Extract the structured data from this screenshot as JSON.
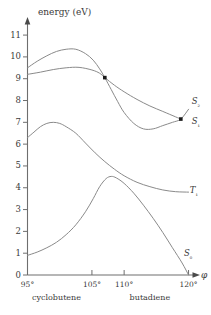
{
  "chart_data": {
    "type": "line",
    "title": "",
    "xlabel": "φ",
    "ylabel": "energy (eV)",
    "xlim": [
      95,
      121
    ],
    "ylim": [
      0,
      11.6
    ],
    "grid": false,
    "legend_position": "inline-right",
    "x_tick_labels": [
      "95°",
      "105°",
      "110°",
      "120°"
    ],
    "x_tick_values": [
      95,
      105,
      110,
      120
    ],
    "y_tick_labels": [
      "0",
      "1",
      "2",
      "3",
      "4",
      "5",
      "6",
      "7",
      "8",
      "9",
      "10",
      "11"
    ],
    "y_tick_values": [
      0,
      1,
      2,
      3,
      4,
      5,
      6,
      7,
      8,
      9,
      10,
      11
    ],
    "annotations": [
      {
        "name": "cyclobutene",
        "text": "cyclobutene",
        "x": 99.5
      },
      {
        "name": "butadiene",
        "text": "butadiene",
        "x": 114.0
      }
    ],
    "markers": [
      {
        "name": "conical-intersection",
        "x": 107.0,
        "y": 9.05
      },
      {
        "name": "s1-s2-convergence",
        "x": 118.8,
        "y": 7.15
      }
    ],
    "series": [
      {
        "name": "S2",
        "label": "S₂",
        "label_x": 120.8,
        "label_y": 7.95,
        "points": [
          [
            95.0,
            9.5
          ],
          [
            96.5,
            9.8
          ],
          [
            98.0,
            10.05
          ],
          [
            99.5,
            10.25
          ],
          [
            101.0,
            10.35
          ],
          [
            102.5,
            10.35
          ],
          [
            104.0,
            10.15
          ],
          [
            105.2,
            9.85
          ],
          [
            106.2,
            9.45
          ],
          [
            107.0,
            9.05
          ],
          [
            108.0,
            8.5
          ],
          [
            109.0,
            7.95
          ],
          [
            110.0,
            7.45
          ],
          [
            111.5,
            6.95
          ],
          [
            113.0,
            6.7
          ],
          [
            114.5,
            6.7
          ],
          [
            116.0,
            6.85
          ],
          [
            117.5,
            7.0
          ],
          [
            118.8,
            7.15
          ],
          [
            120.0,
            7.6
          ]
        ]
      },
      {
        "name": "S1",
        "label": "S₁",
        "label_x": 120.8,
        "label_y": 7.0,
        "points": [
          [
            95.0,
            9.2
          ],
          [
            97.0,
            9.3
          ],
          [
            99.0,
            9.42
          ],
          [
            101.0,
            9.5
          ],
          [
            103.0,
            9.52
          ],
          [
            105.0,
            9.4
          ],
          [
            106.2,
            9.25
          ],
          [
            107.0,
            9.05
          ],
          [
            108.5,
            8.7
          ],
          [
            110.0,
            8.4
          ],
          [
            112.0,
            8.05
          ],
          [
            114.0,
            7.75
          ],
          [
            116.0,
            7.5
          ],
          [
            118.0,
            7.25
          ],
          [
            118.8,
            7.15
          ]
        ]
      },
      {
        "name": "T1",
        "label": "T₁",
        "label_x": 120.5,
        "label_y": 3.85,
        "points": [
          [
            95.0,
            6.3
          ],
          [
            96.0,
            6.55
          ],
          [
            97.0,
            6.8
          ],
          [
            98.0,
            6.95
          ],
          [
            99.0,
            7.0
          ],
          [
            100.0,
            6.95
          ],
          [
            101.0,
            6.8
          ],
          [
            102.5,
            6.5
          ],
          [
            104.0,
            6.05
          ],
          [
            105.5,
            5.6
          ],
          [
            107.0,
            5.2
          ],
          [
            108.5,
            4.85
          ],
          [
            110.0,
            4.55
          ],
          [
            112.0,
            4.25
          ],
          [
            114.0,
            4.05
          ],
          [
            116.0,
            3.9
          ],
          [
            118.0,
            3.82
          ],
          [
            120.0,
            3.8
          ]
        ]
      },
      {
        "name": "S0",
        "label": "S₀",
        "label_x": 119.6,
        "label_y": 0.95,
        "points": [
          [
            95.0,
            0.9
          ],
          [
            96.5,
            1.05
          ],
          [
            98.0,
            1.25
          ],
          [
            99.5,
            1.5
          ],
          [
            101.0,
            1.85
          ],
          [
            102.5,
            2.3
          ],
          [
            104.0,
            2.9
          ],
          [
            105.2,
            3.5
          ],
          [
            106.2,
            4.05
          ],
          [
            107.2,
            4.42
          ],
          [
            108.0,
            4.52
          ],
          [
            108.8,
            4.45
          ],
          [
            110.0,
            4.2
          ],
          [
            111.5,
            3.75
          ],
          [
            113.0,
            3.2
          ],
          [
            114.5,
            2.6
          ],
          [
            116.0,
            1.95
          ],
          [
            117.5,
            1.25
          ],
          [
            119.0,
            0.55
          ],
          [
            120.0,
            0.0
          ]
        ]
      }
    ]
  },
  "axes": {
    "y_title": "energy (eV)",
    "x_title": "φ"
  }
}
